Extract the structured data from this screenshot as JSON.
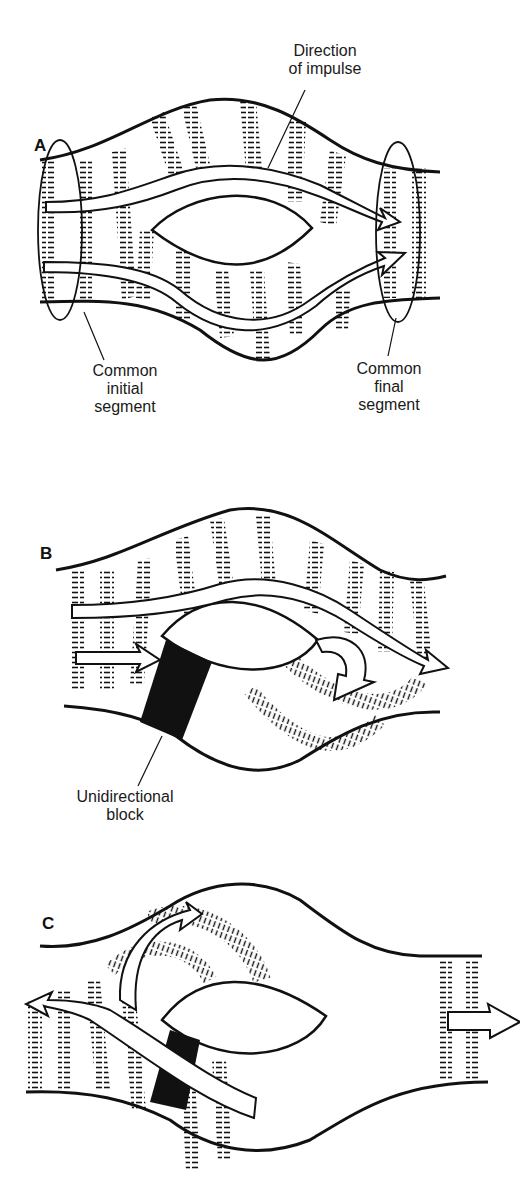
{
  "figure": {
    "panels": [
      {
        "id": "A",
        "letter": "A",
        "labels": {
          "direction_line1": "Direction",
          "direction_line2": "of impulse",
          "initial_line1": "Common",
          "initial_line2": "initial",
          "initial_line3": "segment",
          "final_line1": "Common",
          "final_line2": "final",
          "final_line3": "segment"
        }
      },
      {
        "id": "B",
        "letter": "B",
        "labels": {
          "block_line1": "Unidirectional",
          "block_line2": "block"
        }
      },
      {
        "id": "C",
        "letter": "C",
        "labels": {}
      }
    ],
    "colors": {
      "ink": "#111111",
      "background": "#ffffff"
    }
  }
}
